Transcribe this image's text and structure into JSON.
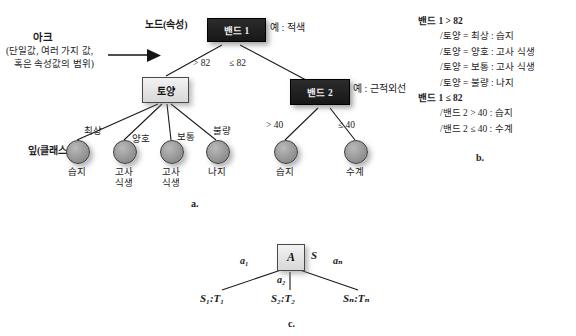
{
  "figure_a": {
    "caption": "a.",
    "annotations": {
      "arc_title": "아크",
      "arc_desc_line1": "(단일값, 여러 가지 값,",
      "arc_desc_line2": "혹은 속성값의 범위)",
      "node_label": "노드(속성)",
      "leaf_label": "잎(클래스)",
      "example_band1": "예 : 적색",
      "example_band2": "예 : 근적외선"
    },
    "nodes": [
      {
        "id": "band1",
        "label": "밴드 1",
        "style": "dark"
      },
      {
        "id": "soil",
        "label": "토양",
        "style": "light"
      },
      {
        "id": "band2",
        "label": "밴드 2",
        "style": "dark"
      }
    ],
    "branch_labels": {
      "band1_left": "> 82",
      "band1_right": "≤ 82",
      "band2_left": "> 40",
      "band2_right": "≤ 40",
      "soil_1": "최상",
      "soil_2": "양호",
      "soil_3": "보통",
      "soil_4": "불량"
    },
    "leaves": [
      {
        "id": "leaf1",
        "line1": "습지",
        "line2": ""
      },
      {
        "id": "leaf2",
        "line1": "고사",
        "line2": "식생"
      },
      {
        "id": "leaf3",
        "line1": "고사",
        "line2": "식생"
      },
      {
        "id": "leaf4",
        "line1": "나지",
        "line2": ""
      },
      {
        "id": "leaf5",
        "line1": "습지",
        "line2": ""
      },
      {
        "id": "leaf6",
        "line1": "수계",
        "line2": ""
      }
    ]
  },
  "figure_b": {
    "caption": "b.",
    "groups": [
      {
        "head": "밴드 1 > 82",
        "rules": [
          "/토양 = 최상 : 습지",
          "/토양 = 양호 : 고사 식생",
          "/토양 = 보통 : 고사 식생",
          "/토양 = 불량 : 나지"
        ]
      },
      {
        "head": "밴드 1 ≤ 82",
        "rules": [
          "/밴드 2 > 40 : 습지",
          "/밴드 2 ≤ 40 : 수계"
        ]
      }
    ]
  },
  "figure_c": {
    "caption": "c.",
    "root_label": "A",
    "root_side_label": "S",
    "arc_labels": [
      "a₁",
      "a₂",
      "aₙ"
    ],
    "leaf_labels": [
      "S₁:T₁",
      "S₂:T₂",
      "Sₙ:Tₙ"
    ]
  },
  "colors": {
    "dark_node": "#1d1d1d",
    "light_node": "#e4e4e4",
    "leaf_circle": "#969696",
    "text": "#1b1b1b",
    "line": "#1a1a1a"
  }
}
